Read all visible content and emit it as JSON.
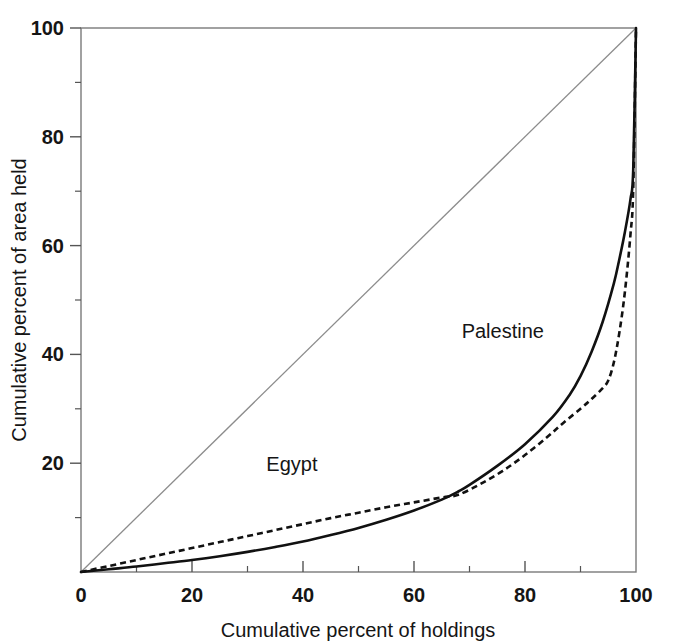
{
  "chart_data": {
    "type": "line",
    "title": "",
    "subtitle": "",
    "xlabel": "Cumulative percent of holdings",
    "ylabel": "Cumulative percent of area held",
    "xlim": [
      0,
      100
    ],
    "ylim": [
      0,
      100
    ],
    "x_major_ticks": [
      0,
      20,
      40,
      60,
      80,
      100
    ],
    "x_minor_ticks": [
      10,
      30,
      50,
      70,
      90
    ],
    "y_major_ticks": [
      0,
      20,
      40,
      60,
      80,
      100
    ],
    "y_minor_ticks": [
      10,
      30,
      50,
      70,
      90
    ],
    "x_tick_labels": [
      "0",
      "20",
      "40",
      "60",
      "80",
      "100"
    ],
    "y_tick_labels": [
      "0",
      "20",
      "40",
      "60",
      "80",
      "100"
    ],
    "y_tick_labels_shown": [
      "20",
      "40",
      "60",
      "80",
      "100"
    ],
    "grid": false,
    "legend_position": "inline-annotation",
    "reference_line": {
      "name": "line of equality",
      "style": "thin-solid-gray",
      "color": "#8c8c8c",
      "x": [
        0,
        100
      ],
      "y": [
        0,
        100
      ]
    },
    "series": [
      {
        "name": "Palestine",
        "style": "solid",
        "color": "#111111",
        "line_width": 2.6,
        "label_x": 76,
        "label_y": 43,
        "x": [
          0,
          5,
          10,
          15,
          20,
          25,
          30,
          35,
          40,
          45,
          50,
          55,
          60,
          65,
          68,
          70,
          75,
          80,
          85,
          88,
          90,
          92,
          94,
          96,
          97,
          98,
          99,
          99.5,
          100
        ],
        "y": [
          0,
          0.5,
          1.0,
          1.6,
          2.2,
          2.9,
          3.7,
          4.6,
          5.6,
          6.8,
          8.1,
          9.6,
          11.3,
          13.3,
          14.8,
          16.0,
          19.5,
          23.5,
          28.5,
          32.5,
          36.0,
          40.5,
          46.0,
          53.0,
          57.5,
          62.5,
          68.5,
          74.0,
          100
        ]
      },
      {
        "name": "Egypt",
        "style": "dashed",
        "color": "#111111",
        "line_width": 2.6,
        "dash_pattern": "6,4",
        "label_x": 38,
        "label_y": 18.5,
        "x": [
          0,
          5,
          10,
          15,
          20,
          25,
          30,
          35,
          40,
          45,
          50,
          55,
          60,
          65,
          68,
          72,
          76,
          80,
          84,
          87,
          90,
          92,
          94,
          95,
          96,
          97,
          98,
          99,
          99.5,
          100
        ],
        "y": [
          0,
          1.1,
          2.2,
          3.3,
          4.4,
          5.5,
          6.6,
          7.7,
          8.8,
          9.9,
          10.9,
          11.9,
          12.8,
          13.7,
          14.2,
          16.2,
          18.6,
          21.5,
          24.8,
          27.5,
          30.0,
          31.8,
          33.8,
          35.2,
          38.5,
          44.0,
          51.5,
          62.0,
          70.5,
          100
        ]
      }
    ],
    "annotations": [
      {
        "text": "Palestine",
        "x": 76,
        "y": 43
      },
      {
        "text": "Egypt",
        "x": 38,
        "y": 18.5
      }
    ]
  },
  "axes": {
    "x_title": "Cumulative percent of holdings",
    "y_title": "Cumulative percent of area held",
    "x_labels": [
      "0",
      "20",
      "40",
      "60",
      "80",
      "100"
    ],
    "y_labels": [
      "100",
      "80",
      "60",
      "40",
      "20"
    ]
  },
  "labels": {
    "palestine": "Palestine",
    "egypt": "Egypt"
  },
  "colors": {
    "axis": "#7a7a7a",
    "curve": "#111111",
    "reference": "#8c8c8c",
    "text": "#151515",
    "background": "#ffffff"
  }
}
